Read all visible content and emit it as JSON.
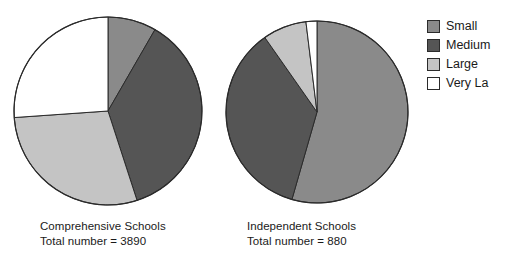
{
  "chart_data": {
    "type": "pie",
    "title": "",
    "legend_position": "right",
    "categories": [
      "Small",
      "Medium",
      "Large",
      "Very Large"
    ],
    "colors": {
      "Small": "#8a8a8a",
      "Medium": "#555555",
      "Large": "#c4c4c4",
      "Very Large": "#ffffff"
    },
    "outline_color": "#2b2b2b",
    "charts": [
      {
        "name": "Comprehensive Schools",
        "label_line1": "Comprehensive Schools",
        "label_line2": "Total number = 3890",
        "total": 3890,
        "start_angle_deg": 0,
        "direction": "clockwise",
        "slices": [
          {
            "label": "Small",
            "angle_deg": 30,
            "percent": 8.3
          },
          {
            "label": "Medium",
            "angle_deg": 132,
            "percent": 36.7
          },
          {
            "label": "Large",
            "angle_deg": 104,
            "percent": 28.9
          },
          {
            "label": "Very Large",
            "angle_deg": 94,
            "percent": 26.1
          }
        ]
      },
      {
        "name": "Independent Schools",
        "label_line1": "Independent Schools",
        "label_line2": "Total number = 880",
        "total": 880,
        "start_angle_deg": 0,
        "direction": "clockwise",
        "slices": [
          {
            "label": "Small",
            "angle_deg": 196,
            "percent": 54.4
          },
          {
            "label": "Medium",
            "angle_deg": 129,
            "percent": 35.8
          },
          {
            "label": "Large",
            "angle_deg": 28,
            "percent": 7.8
          },
          {
            "label": "Very Large",
            "angle_deg": 7,
            "percent": 2.0
          }
        ]
      }
    ]
  },
  "legend": {
    "items": [
      {
        "label": "Small",
        "color": "#8a8a8a"
      },
      {
        "label": "Medium",
        "color": "#555555"
      },
      {
        "label": "Large",
        "color": "#c4c4c4"
      },
      {
        "label": "Very La",
        "color": "#ffffff"
      }
    ]
  },
  "charts_layout": [
    {
      "cx": 108,
      "cy": 111,
      "r": 94,
      "caption_left": 40,
      "caption_top": 219
    },
    {
      "cx": 317,
      "cy": 112,
      "r": 91,
      "caption_left": 247,
      "caption_top": 219
    }
  ]
}
